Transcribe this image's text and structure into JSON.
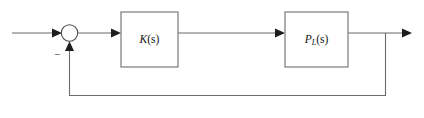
{
  "diagram": {
    "background_color": "#ffffff",
    "line_color": "#6b6b6b",
    "arrow_color": "#1d1d1d",
    "block_border_color": "#6d6d6d",
    "blocks": [
      {
        "id": "controller",
        "label_main": "K",
        "label_sub": "",
        "label_arg": "(s)",
        "label_full": "K(s)"
      },
      {
        "id": "plant",
        "label_main": "P",
        "label_sub": "L",
        "label_arg": "(s)",
        "label_full": "PL(s)"
      }
    ],
    "summing_junction": {
      "id": "sum-junction",
      "feedback_sign": "−",
      "shape": "circle"
    },
    "signals": {
      "input": "input-signal-line",
      "error": "error-signal-line",
      "control": "control-signal-line",
      "output": "output-signal-line",
      "feedback": "feedback-signal-line"
    }
  }
}
